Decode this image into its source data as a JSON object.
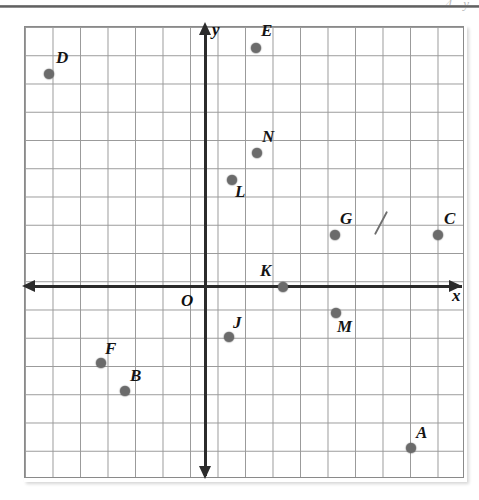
{
  "page": {
    "header_ghost_text": "4  y",
    "background_color": "#ffffff",
    "grid_line_color": "#9a9a9a",
    "axis_color": "#2b2b2b",
    "point_color": "#6b6b6b"
  },
  "axes": {
    "x_label": "x",
    "y_label": "y",
    "origin_label": "O"
  },
  "chart_data": {
    "type": "scatter",
    "title": "",
    "xlabel": "x",
    "ylabel": "y",
    "grid": true,
    "legend": "none",
    "xlim": [
      -7,
      9
    ],
    "ylim": [
      -7,
      9
    ],
    "annotations": [
      {
        "name": "pencil-slash-mark",
        "x": 6.5,
        "y": 2.5
      }
    ],
    "points": [
      {
        "label": "D",
        "x": -6,
        "y": 7,
        "px": 49,
        "py": 74,
        "lx": 56,
        "ly": 48
      },
      {
        "label": "E",
        "x": 2,
        "y": 8,
        "px": 256,
        "py": 48,
        "lx": 261,
        "ly": 21
      },
      {
        "label": "N",
        "x": 2,
        "y": 5,
        "px": 257,
        "py": 153,
        "lx": 262,
        "ly": 127
      },
      {
        "label": "L",
        "x": 1,
        "y": 4,
        "px": 232,
        "py": 180,
        "lx": 235,
        "ly": 182
      },
      {
        "label": "G",
        "x": 5,
        "y": 2,
        "px": 335,
        "py": 235,
        "lx": 340,
        "ly": 209
      },
      {
        "label": "C",
        "x": 9,
        "y": 2,
        "px": 438,
        "py": 235,
        "lx": 444,
        "ly": 209
      },
      {
        "label": "K",
        "x": 3,
        "y": 0,
        "px": 283,
        "py": 287,
        "lx": 260,
        "ly": 261
      },
      {
        "label": "M",
        "x": 5,
        "y": -1,
        "px": 336,
        "py": 313,
        "lx": 337,
        "ly": 317
      },
      {
        "label": "J",
        "x": 1,
        "y": -2,
        "px": 229,
        "py": 337,
        "lx": 233,
        "ly": 313
      },
      {
        "label": "F",
        "x": -4,
        "y": -3,
        "px": 101,
        "py": 363,
        "lx": 105,
        "ly": 339
      },
      {
        "label": "B",
        "x": -3,
        "y": -4,
        "px": 125,
        "py": 391,
        "lx": 130,
        "ly": 366
      },
      {
        "label": "A",
        "x": 8,
        "y": -6,
        "px": 411,
        "py": 448,
        "lx": 416,
        "ly": 423
      }
    ]
  }
}
